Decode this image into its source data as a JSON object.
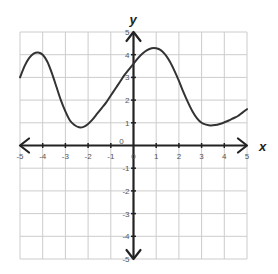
{
  "chart_data": {
    "type": "line",
    "title": "",
    "xlabel": "x",
    "ylabel": "y",
    "xlim": [
      -5,
      5
    ],
    "ylim": [
      -5,
      5
    ],
    "grid": true,
    "x_ticks": [
      -5,
      -4,
      -3,
      -2,
      -1,
      0,
      1,
      2,
      3,
      4,
      5
    ],
    "y_ticks": [
      -5,
      -4,
      -3,
      -2,
      -1,
      0,
      1,
      2,
      3,
      4,
      5
    ],
    "x_tick_labels": [
      "-5",
      "-4",
      "-3",
      "-2",
      "-1",
      "0",
      "1",
      "2",
      "3",
      "4",
      "5"
    ],
    "y_tick_labels": [
      "-5",
      "-4",
      "-3",
      "-2",
      "-1",
      "0",
      "1",
      "2",
      "3",
      "4",
      "5"
    ],
    "origin_label": "0",
    "series": [
      {
        "name": "f(x)",
        "color": "#333333",
        "points": [
          [
            -5.0,
            3.0
          ],
          [
            -4.8,
            3.5
          ],
          [
            -4.6,
            3.85
          ],
          [
            -4.4,
            4.05
          ],
          [
            -4.2,
            4.1
          ],
          [
            -4.0,
            4.0
          ],
          [
            -3.8,
            3.7
          ],
          [
            -3.6,
            3.2
          ],
          [
            -3.4,
            2.6
          ],
          [
            -3.2,
            2.0
          ],
          [
            -3.0,
            1.5
          ],
          [
            -2.8,
            1.1
          ],
          [
            -2.6,
            0.9
          ],
          [
            -2.4,
            0.8
          ],
          [
            -2.2,
            0.82
          ],
          [
            -2.0,
            0.95
          ],
          [
            -1.8,
            1.15
          ],
          [
            -1.6,
            1.4
          ],
          [
            -1.4,
            1.65
          ],
          [
            -1.2,
            1.9
          ],
          [
            -1.0,
            2.2
          ],
          [
            -0.8,
            2.5
          ],
          [
            -0.6,
            2.8
          ],
          [
            -0.4,
            3.1
          ],
          [
            -0.2,
            3.35
          ],
          [
            0.0,
            3.6
          ],
          [
            0.2,
            3.85
          ],
          [
            0.4,
            4.05
          ],
          [
            0.6,
            4.2
          ],
          [
            0.8,
            4.28
          ],
          [
            1.0,
            4.28
          ],
          [
            1.2,
            4.2
          ],
          [
            1.4,
            4.0
          ],
          [
            1.6,
            3.7
          ],
          [
            1.8,
            3.3
          ],
          [
            2.0,
            2.85
          ],
          [
            2.2,
            2.35
          ],
          [
            2.4,
            1.9
          ],
          [
            2.6,
            1.5
          ],
          [
            2.8,
            1.2
          ],
          [
            3.0,
            1.0
          ],
          [
            3.2,
            0.92
          ],
          [
            3.4,
            0.88
          ],
          [
            3.6,
            0.9
          ],
          [
            3.8,
            0.95
          ],
          [
            4.0,
            1.02
          ],
          [
            4.2,
            1.1
          ],
          [
            4.4,
            1.2
          ],
          [
            4.6,
            1.3
          ],
          [
            4.8,
            1.45
          ],
          [
            5.0,
            1.6
          ]
        ]
      }
    ],
    "key_points": {
      "start": [
        -5,
        3
      ],
      "local_max_1": [
        -4.2,
        4.1
      ],
      "local_min_1": [
        -2.3,
        0.8
      ],
      "y_intercept": [
        0,
        3.6
      ],
      "local_max_2": [
        0.9,
        4.3
      ],
      "local_min_2": [
        3.5,
        0.9
      ],
      "end": [
        5,
        1.6
      ]
    }
  },
  "colors": {
    "grid": "#cccccc",
    "axis": "#222222",
    "curve": "#333333",
    "tick_label": "#555555"
  }
}
